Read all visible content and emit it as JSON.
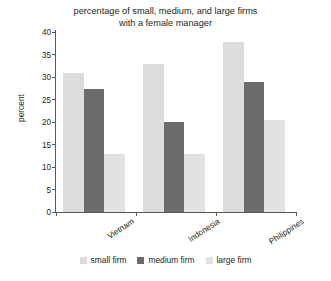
{
  "chart_data": {
    "type": "bar",
    "title": "percentage of small, medium, and large firms with a female manager",
    "title_lines": [
      "percentage of small, medium, and large firms",
      "with a female manager"
    ],
    "xlabel": "",
    "ylabel": "percent",
    "categories": [
      "Vietnam",
      "Indonesia",
      "Philippines"
    ],
    "series": [
      {
        "name": "small firm",
        "values": [
          30.8,
          32.8,
          37.8
        ],
        "color": "#dcdcdc"
      },
      {
        "name": "medium firm",
        "values": [
          27.3,
          20.0,
          28.8
        ],
        "color": "#6b6b6b"
      },
      {
        "name": "large firm",
        "values": [
          12.8,
          13.0,
          20.5
        ],
        "color": "#e2e2e2"
      }
    ],
    "ylim": [
      0,
      40
    ],
    "yticks": [
      0,
      5,
      10,
      15,
      20,
      25,
      30,
      35,
      40
    ],
    "ytick_labels": [
      "0",
      "5",
      "10",
      "15",
      "20",
      "25",
      "30",
      "35",
      "40"
    ],
    "grid": false,
    "legend_position": "bottom",
    "axis_color": "#58595b",
    "background": "#ffffff"
  }
}
